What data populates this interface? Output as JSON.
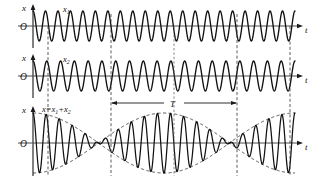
{
  "figure": {
    "background_color": "#ffffff",
    "curve_color": "#111111",
    "axis_color": "#4a4a4a",
    "guide_color": "#3d3d3d"
  },
  "panels": [
    {
      "id": "panel-x1",
      "vertical_axis_label": "x",
      "origin_label": "O",
      "horizontal_axis_label": "t",
      "wave_label": "x",
      "wave_label_sub": "1",
      "cycles": 21,
      "amplitude_label": "A"
    },
    {
      "id": "panel-x2",
      "vertical_axis_label": "x",
      "origin_label": "O",
      "horizontal_axis_label": "t",
      "wave_label": "x",
      "wave_label_sub": "2",
      "cycles": 19,
      "amplitude_label": "A"
    },
    {
      "id": "panel-sum",
      "vertical_axis_label": "x",
      "origin_label": "O",
      "horizontal_axis_label": "t",
      "equation_label": "x=x",
      "equation_sub1": "1",
      "equation_mid": "+x",
      "equation_sub2": "2",
      "period_label": "T",
      "beat_count": 2
    }
  ],
  "chart_data": {
    "type": "line",
    "xlabel": "t",
    "ylabel": "x",
    "grid": false,
    "legend": "none",
    "xlim": [
      0,
      1
    ],
    "ylim": [
      -2,
      2
    ],
    "series": [
      {
        "name": "x1",
        "panel": "panel-x1",
        "form": "A*cos(2*pi*f1*t)",
        "amplitude": 1,
        "cycles_over_span": 21,
        "ylim": [
          -1,
          1
        ]
      },
      {
        "name": "x2",
        "panel": "panel-x2",
        "form": "A*cos(2*pi*f2*t)",
        "amplitude": 1,
        "cycles_over_span": 19,
        "ylim": [
          -1,
          1
        ]
      },
      {
        "name": "x = x1 + x2",
        "panel": "panel-sum",
        "form": "2*A*cos(pi*(f1-f2)*t)*cos(pi*(f1+f2)*t)",
        "amplitude": 2,
        "cycles_over_span": 20,
        "beat_periods_shown": 2,
        "envelope_form": "+/- 2*A*cos(pi*(f1-f2)*t)",
        "ylim": [
          -2,
          2
        ]
      }
    ],
    "annotations": [
      {
        "text": "T",
        "meaning": "beat period",
        "between_guides": [
          1,
          3
        ]
      },
      {
        "text": "x=x1+x2",
        "meaning": "superposition equation"
      }
    ],
    "guide_lines_t": [
      0.055,
      0.285,
      0.5,
      0.715,
      0.945
    ]
  }
}
